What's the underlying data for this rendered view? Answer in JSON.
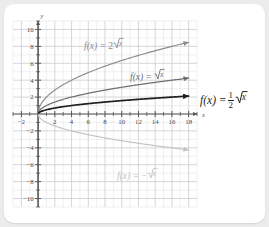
{
  "chart_data": {
    "type": "line",
    "title": "",
    "xlabel": "x",
    "ylabel": "y",
    "xlim": [
      -3,
      19
    ],
    "ylim": [
      -11,
      11
    ],
    "grid": true,
    "minor_grid_step": 1,
    "major_grid_step": 2,
    "legend_position": "inline-annotations",
    "x_ticks": [
      -2,
      2,
      4,
      6,
      8,
      10,
      12,
      14,
      16,
      18
    ],
    "x_tick_labels": [
      "-2",
      "2",
      "4",
      "6",
      "8",
      "10",
      "12",
      "14",
      "16",
      "18"
    ],
    "y_ticks": [
      10,
      8,
      6,
      4,
      2,
      -2,
      -4,
      -6,
      -8,
      -10
    ],
    "y_tick_labels": [
      "10",
      "8",
      "6",
      "4",
      "2",
      "-2",
      "-4",
      "-6",
      "-8",
      "-10"
    ],
    "series": [
      {
        "name": "f(x) = 2√x",
        "coefficient": 2,
        "color": "#8c8c90",
        "domain": [
          0,
          18
        ],
        "x": [
          0,
          1,
          2,
          3,
          4,
          5,
          6,
          7,
          8,
          9,
          10,
          11,
          12,
          13,
          14,
          15,
          16,
          17,
          18
        ],
        "y": [
          0,
          2,
          2.83,
          3.46,
          4,
          4.47,
          4.9,
          5.29,
          5.66,
          6,
          6.32,
          6.63,
          6.93,
          7.21,
          7.48,
          7.75,
          8,
          8.25,
          8.49
        ],
        "arrow": "end"
      },
      {
        "name": "f(x) = √x",
        "coefficient": 1,
        "color": "#6f6f73",
        "domain": [
          0,
          18
        ],
        "x": [
          0,
          1,
          2,
          3,
          4,
          5,
          6,
          7,
          8,
          9,
          10,
          11,
          12,
          13,
          14,
          15,
          16,
          17,
          18
        ],
        "y": [
          0,
          1,
          1.41,
          1.73,
          2,
          2.24,
          2.45,
          2.65,
          2.83,
          3,
          3.16,
          3.32,
          3.46,
          3.61,
          3.74,
          3.87,
          4,
          4.12,
          4.24
        ],
        "arrow": "end"
      },
      {
        "name": "f(x) = 1/2 √x",
        "coefficient": 0.5,
        "color": "#231f20",
        "domain": [
          0,
          18
        ],
        "x": [
          0,
          1,
          2,
          3,
          4,
          5,
          6,
          7,
          8,
          9,
          10,
          11,
          12,
          13,
          14,
          15,
          16,
          17,
          18
        ],
        "y": [
          0,
          0.5,
          0.71,
          0.87,
          1,
          1.12,
          1.22,
          1.32,
          1.41,
          1.5,
          1.58,
          1.66,
          1.73,
          1.8,
          1.87,
          1.94,
          2,
          2.06,
          2.12
        ],
        "arrow": "end"
      },
      {
        "name": "f(x) = -√x",
        "coefficient": -1,
        "color": "#c3c3c6",
        "domain": [
          0,
          18
        ],
        "x": [
          0,
          1,
          2,
          3,
          4,
          5,
          6,
          7,
          8,
          9,
          10,
          11,
          12,
          13,
          14,
          15,
          16,
          17,
          18
        ],
        "y": [
          0,
          -1,
          -1.41,
          -1.73,
          -2,
          -2.24,
          -2.45,
          -2.65,
          -2.83,
          -3,
          -3.16,
          -3.32,
          -3.46,
          -3.61,
          -3.74,
          -3.87,
          -4,
          -4.12,
          -4.24
        ],
        "arrow": "end"
      }
    ]
  },
  "axes": {
    "y_axis_label": "y",
    "x_axis_label": "x"
  },
  "annotations": {
    "curve_2sqrt": {
      "fx": "f(x)",
      "eq": "=",
      "coef": "2",
      "radicand": "x"
    },
    "curve_sqrt": {
      "fx": "f(x)",
      "eq": "=",
      "coef": "",
      "radicand": "x"
    },
    "curve_half": {
      "fx": "f(x)",
      "eq": "=",
      "num": "1",
      "den": "2",
      "radicand": "x"
    },
    "curve_neg": {
      "fx": "f(x)",
      "eq": "=",
      "coef": "−",
      "radicand": "x"
    }
  },
  "colors": {
    "page_background": "#ececed",
    "card_background": "#ffffff",
    "minor_grid": "#e3e3e6",
    "major_grid": "#cfcfd4",
    "axis": "#58585b",
    "curve_dark": "#231f20",
    "curve_mid": "#6f6f73",
    "curve_light": "#8c8c90",
    "curve_pale": "#c3c3c6"
  }
}
